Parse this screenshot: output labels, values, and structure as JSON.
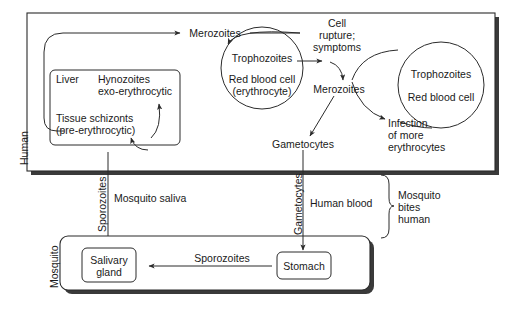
{
  "diagram": {
    "colors": {
      "stroke": "#2b2b2b",
      "shadow": "#3a3a3a",
      "text": "#1a1a1a",
      "background": "#ffffff"
    },
    "compartments": [
      {
        "id": "human",
        "label": "Human"
      },
      {
        "id": "mosquito",
        "label": "Mosquito"
      }
    ],
    "human": {
      "label": "Human",
      "top_arrow_label": "Merozoites",
      "liver_box": {
        "organ_label": "Liver",
        "stage_upper_line1": "Hynozoites",
        "stage_upper_line2": "exo-erythrocytic",
        "stage_lower_line1": "Tissue schizonts",
        "stage_lower_line2": "(pre-erythrocytic)"
      },
      "cell_left": {
        "stage": "Trophozoites",
        "host_line1": "Red blood cell",
        "host_line2": "(erythrocyte)"
      },
      "cell_right": {
        "stage": "Trophozoites",
        "host_line1": "Red blood cell"
      },
      "rupture_line1": "Cell",
      "rupture_line2": "rupture;",
      "rupture_line3": "symptoms",
      "merozoites_label": "Merozoites",
      "gametocytes_label": "Gametocytes",
      "reinfection_line1": "Infection",
      "reinfection_line2": "of more",
      "reinfection_line3": "erythrocytes"
    },
    "transmission": {
      "sporozoites_vertical": "Sporozoites",
      "mosquito_saliva": "Mosquito saliva",
      "gametocytes_vertical": "Gametocytes",
      "human_blood": "Human blood",
      "brace_line1": "Mosquito",
      "brace_line2": "bites",
      "brace_line3": "human"
    },
    "mosquito": {
      "label": "Mosquito",
      "salivary_gland_line1": "Salivary",
      "salivary_gland_line2": "gland",
      "sporozoites_arrow_label": "Sporozoites",
      "stomach_label": "Stomach"
    }
  }
}
